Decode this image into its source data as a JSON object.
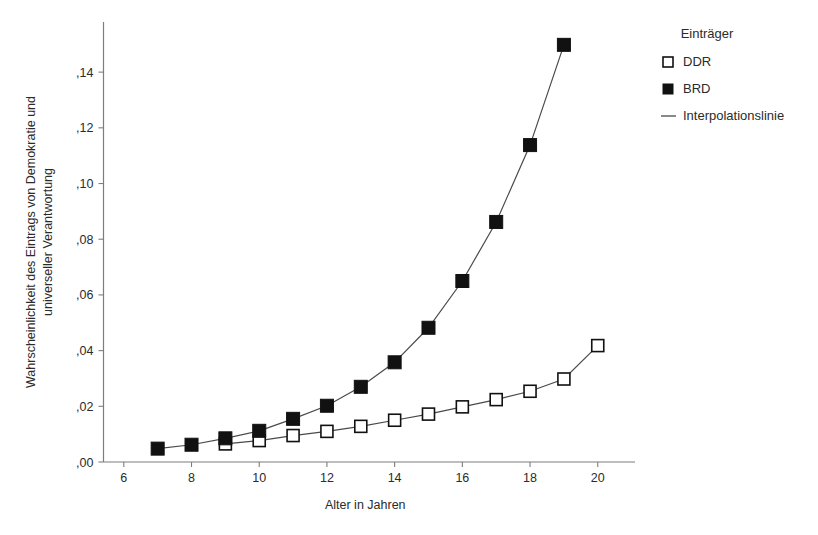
{
  "chart_data": {
    "type": "scatter",
    "title": "",
    "xlabel": "Alter in Jahren",
    "ylabel": "Wahrscheinlichkeit des Eintrags von Demokratie und universeller Verantwortung",
    "ylabel_lines": [
      "Wahrscheinlichkeit des Eintrags von Demokratie und",
      "universeller Verantwortung"
    ],
    "xlim": [
      5.4,
      21.1
    ],
    "ylim": [
      0.0,
      0.158
    ],
    "grid": false,
    "xticks": [
      6,
      8,
      10,
      12,
      14,
      16,
      18,
      20
    ],
    "xtick_labels": [
      "6",
      "8",
      "10",
      "12",
      "14",
      "16",
      "18",
      "20"
    ],
    "yticks": [
      0.0,
      0.02,
      0.04,
      0.06,
      0.08,
      0.1,
      0.12,
      0.14
    ],
    "ytick_labels": [
      ",00",
      ",02",
      ",04",
      ",06",
      ",08",
      ",10",
      ",12",
      ",14"
    ],
    "legend_position": "right-top",
    "legend_title": "Einträger",
    "series": [
      {
        "name": "DDR",
        "marker": "open-square",
        "x": [
          9,
          10,
          11,
          12,
          13,
          14,
          15,
          16,
          17,
          18,
          19,
          20
        ],
        "values": [
          0.0065,
          0.0077,
          0.0095,
          0.011,
          0.0128,
          0.015,
          0.0172,
          0.0198,
          0.0224,
          0.0254,
          0.0298,
          0.0418
        ]
      },
      {
        "name": "BRD",
        "marker": "filled-square",
        "x": [
          7,
          8,
          9,
          10,
          11,
          12,
          13,
          14,
          15,
          16,
          17,
          18,
          19
        ],
        "values": [
          0.0048,
          0.0062,
          0.0085,
          0.0112,
          0.0155,
          0.0202,
          0.027,
          0.0358,
          0.0482,
          0.065,
          0.0862,
          0.1138,
          0.1498
        ]
      }
    ],
    "interpolation_label": "Interpolationslinie"
  },
  "legend": {
    "title": "Einträger",
    "items": [
      {
        "label": "DDR",
        "marker": "open-square"
      },
      {
        "label": "BRD",
        "marker": "filled-square"
      },
      {
        "label": "Interpolationslinie",
        "marker": "line"
      }
    ]
  },
  "axes": {
    "x_title": "Alter in Jahren",
    "y_title_line1": "Wahrscheinlichkeit des Eintrags von Demokratie und",
    "y_title_line2": "universeller Verantwortung"
  },
  "colors": {
    "background": "#ffffff",
    "axis": "#7d7d7d",
    "text": "#2b2b2b",
    "series_line": "#4a4a4a",
    "marker_fill": "#111111",
    "marker_open_fill": "#ffffff"
  }
}
